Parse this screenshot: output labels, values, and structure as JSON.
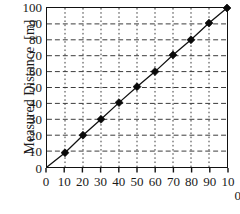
{
  "chart_data": {
    "type": "scatter",
    "title": "",
    "subtitle": "",
    "xlabel": "",
    "ylabel": "Measured Distance  [m]",
    "xlim": [
      0,
      100
    ],
    "ylim": [
      0,
      100
    ],
    "grid": true,
    "legend": null,
    "legend_position": "none",
    "x_ticks": [
      "0",
      "10",
      "20",
      "30",
      "40",
      "50",
      "60",
      "70",
      "80",
      "90",
      "100"
    ],
    "y_ticks": [
      "0",
      "10",
      "20",
      "30",
      "40",
      "50",
      "60",
      "70",
      "80",
      "90",
      "100"
    ],
    "x_tick_values": [
      0,
      10,
      20,
      30,
      40,
      50,
      60,
      70,
      80,
      90,
      100
    ],
    "y_tick_values": [
      0,
      10,
      20,
      30,
      40,
      50,
      60,
      70,
      80,
      90,
      100
    ],
    "x": [
      10,
      20,
      30,
      40,
      50,
      60,
      70,
      80,
      90,
      100
    ],
    "values": [
      9,
      20,
      30,
      40.5,
      50.5,
      60,
      70.5,
      80,
      90.5,
      100
    ],
    "series": [
      {
        "name": "Measured Distance",
        "marker": "diamond",
        "color": "#0a0a0a",
        "line_from_origin": true,
        "points": [
          {
            "x": 10,
            "y": 9
          },
          {
            "x": 20,
            "y": 20
          },
          {
            "x": 30,
            "y": 30
          },
          {
            "x": 40,
            "y": 40.5
          },
          {
            "x": 50,
            "y": 50.5
          },
          {
            "x": 60,
            "y": 60
          },
          {
            "x": 70,
            "y": 70.5
          },
          {
            "x": 80,
            "y": 80
          },
          {
            "x": 90,
            "y": 90.5
          },
          {
            "x": 100,
            "y": 100
          }
        ]
      }
    ],
    "xtick_labels_rendered": [
      {
        "value": 0,
        "line1": "0",
        "line2": ""
      },
      {
        "value": 10,
        "line1": "10",
        "line2": ""
      },
      {
        "value": 20,
        "line1": "20",
        "line2": ""
      },
      {
        "value": 30,
        "line1": "30",
        "line2": ""
      },
      {
        "value": 40,
        "line1": "40",
        "line2": ""
      },
      {
        "value": 50,
        "line1": "50",
        "line2": ""
      },
      {
        "value": 60,
        "line1": "60",
        "line2": ""
      },
      {
        "value": 70,
        "line1": "70",
        "line2": ""
      },
      {
        "value": 80,
        "line1": "80",
        "line2": ""
      },
      {
        "value": 90,
        "line1": "90",
        "line2": ""
      },
      {
        "value": 100,
        "line1": "10",
        "line2": "0"
      }
    ],
    "colors": {
      "axis": "#111111",
      "grid": "#3a3a3a",
      "marker": "#0a0a0a",
      "line": "#111111",
      "background": "#ffffff"
    }
  }
}
